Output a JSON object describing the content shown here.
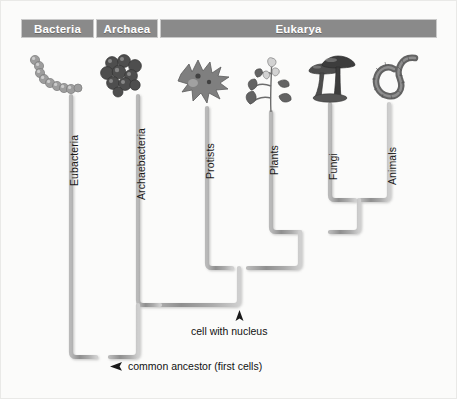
{
  "diagram": {
    "colors": {
      "header_bar": "#8a8a8a",
      "header_text": "#ffffff",
      "branch": "#9a9a9a",
      "background": "#fbfbfa",
      "text": "#111111"
    }
  },
  "domains": [
    {
      "id": "bacteria",
      "label": "Bacteria",
      "x": 21,
      "width": 73
    },
    {
      "id": "archaea",
      "label": "Archaea",
      "x": 96,
      "width": 62
    },
    {
      "id": "eukarya",
      "label": "Eukarya",
      "x": 160,
      "width": 277
    }
  ],
  "branches": [
    {
      "id": "eubacteria",
      "label": "Eubacteria",
      "x": 71,
      "tip_y": 96,
      "domain": "bacteria",
      "organism": "bacteria-chain-icon"
    },
    {
      "id": "archaebacteria",
      "label": "Archaebacteria",
      "x": 138,
      "tip_y": 96,
      "domain": "archaea",
      "organism": "archaea-cluster-icon"
    },
    {
      "id": "protists",
      "label": "Protists",
      "x": 207,
      "tip_y": 108,
      "domain": "eukarya",
      "organism": "protist-icon"
    },
    {
      "id": "plants",
      "label": "Plants",
      "x": 271,
      "tip_y": 112,
      "domain": "eukarya",
      "organism": "plant-icon"
    },
    {
      "id": "fungi",
      "label": "Fungi",
      "x": 330,
      "tip_y": 104,
      "domain": "eukarya",
      "organism": "mushroom-icon"
    },
    {
      "id": "animals",
      "label": "Animals",
      "x": 389,
      "tip_y": 104,
      "domain": "eukarya",
      "organism": "worm-icon"
    }
  ],
  "nodes": [
    {
      "id": "fungi-animals",
      "y": 200,
      "children": [
        "fungi",
        "animals"
      ]
    },
    {
      "id": "plants-fa",
      "y": 232,
      "children": [
        "plants",
        "fungi-animals"
      ]
    },
    {
      "id": "eukaryotes",
      "y": 268,
      "children": [
        "protists",
        "plants-fa"
      ],
      "x": 239,
      "annotation": "cell with nucleus"
    },
    {
      "id": "archaea-eukarya",
      "y": 305,
      "children": [
        "archaebacteria",
        "eukaryotes"
      ]
    },
    {
      "id": "root",
      "y": 357,
      "x": 103,
      "children": [
        "eubacteria",
        "archaea-eukarya"
      ],
      "annotation": "common ancestor (first cells)"
    }
  ],
  "annotations": {
    "cell_with_nucleus": {
      "text": "cell with nucleus",
      "pointer": "up-arrow",
      "label_x": 195,
      "label_y": 323,
      "arrow_x": 239,
      "arrow_y": 308
    },
    "common_ancestor": {
      "text": "common ancestor (first cells)",
      "pointer": "left-arrow",
      "label_x": 129,
      "label_y": 363,
      "arrow_x": 111,
      "arrow_y": 367
    }
  },
  "labels": {
    "vertical_label_top_y": 130
  }
}
